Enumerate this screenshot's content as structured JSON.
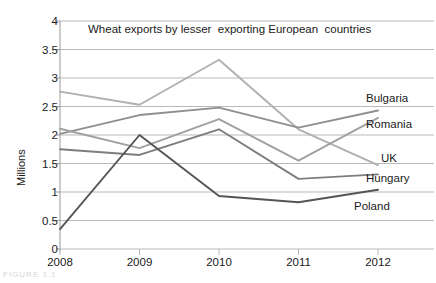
{
  "chart_data": {
    "type": "line",
    "title": "Wheat exports by lesser  exporting European  countries",
    "xlabel": "",
    "ylabel": "Millions",
    "categories": [
      "2008",
      "2009",
      "2010",
      "2011",
      "2012"
    ],
    "x": [
      2008,
      2009,
      2010,
      2011,
      2012
    ],
    "ylim": [
      0,
      4
    ],
    "ytick_labels": [
      "0",
      "0.5",
      "1",
      "1.5",
      "2",
      "2.5",
      "3",
      "3.5",
      "4"
    ],
    "ytick_values": [
      0,
      0.5,
      1,
      1.5,
      2,
      2.5,
      3,
      3.5,
      4
    ],
    "grid": true,
    "legend_position": "inline-right",
    "series": [
      {
        "name": "Bulgaria",
        "values": [
          2.76,
          2.53,
          3.32,
          2.1,
          1.47
        ],
        "color": "#b0b0b0"
      },
      {
        "name": "Romania",
        "values": [
          2.02,
          2.35,
          2.48,
          2.13,
          2.43
        ],
        "color": "#8f8f8f"
      },
      {
        "name": "UK",
        "values": [
          2.11,
          1.77,
          2.28,
          1.55,
          2.3
        ],
        "color": "#a0a0a0"
      },
      {
        "name": "Hungary",
        "values": [
          1.75,
          1.65,
          2.1,
          1.23,
          1.31
        ],
        "color": "#7d7d7d"
      },
      {
        "name": "Poland",
        "values": [
          0.35,
          2.0,
          0.93,
          0.82,
          1.04
        ],
        "color": "#555555"
      }
    ]
  },
  "axis": {
    "y_title": "Millions"
  },
  "labels": {
    "bulgaria": "Bulgaria",
    "romania": "Romania",
    "uk": "UK",
    "hungary": "Hungary",
    "poland": "Poland"
  },
  "caption_fragment": "FIGURE 1.1"
}
